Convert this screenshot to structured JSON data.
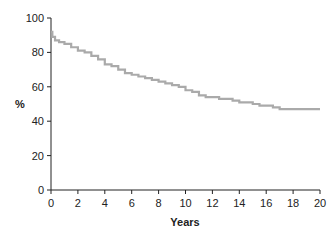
{
  "chart_data": {
    "type": "line",
    "title": "",
    "xlabel": "Years",
    "ylabel": "%",
    "xlim": [
      0,
      20
    ],
    "ylim": [
      0,
      100
    ],
    "x_ticks": [
      0,
      2,
      4,
      6,
      8,
      10,
      12,
      14,
      16,
      18,
      20
    ],
    "y_ticks": [
      0,
      20,
      40,
      60,
      80,
      100
    ],
    "grid": false,
    "legend": null,
    "step": true,
    "series": [
      {
        "name": "survival",
        "color": "#aaaaaa",
        "x": [
          0,
          0.1,
          0.3,
          0.6,
          1.0,
          1.5,
          2.0,
          2.5,
          3.0,
          3.5,
          4.0,
          4.5,
          5.0,
          5.5,
          6.0,
          6.5,
          7.0,
          7.5,
          8.0,
          8.5,
          9.0,
          9.5,
          10.0,
          10.5,
          11.0,
          11.5,
          12.0,
          12.5,
          13.0,
          13.5,
          14.0,
          14.5,
          15.0,
          15.5,
          16.0,
          16.5,
          17.0,
          18.0,
          19.0,
          20.0
        ],
        "y": [
          92,
          89,
          87,
          86,
          85,
          83,
          81,
          80,
          78,
          76,
          73,
          72,
          70,
          68,
          67,
          66,
          65,
          64,
          63,
          62,
          61,
          60,
          58,
          57,
          55,
          54,
          54,
          53,
          53,
          52,
          51,
          51,
          50,
          49,
          49,
          48,
          47,
          47,
          47,
          47
        ]
      }
    ]
  }
}
